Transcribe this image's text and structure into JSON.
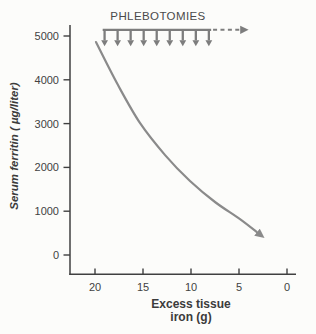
{
  "figure_title": "Serum ferritin response to phlebotomy therapy",
  "chart_data": {
    "type": "line",
    "title": "",
    "xlabel": "Excess tissue iron (g)",
    "xlabel_lines": [
      "Excess tissue",
      "iron (g)"
    ],
    "ylabel": "Serum ferritin ( µg/liter)",
    "x_ticks": [
      20,
      15,
      10,
      5,
      0
    ],
    "y_ticks": [
      0,
      1000,
      2000,
      3000,
      4000,
      5000
    ],
    "x_axis_reversed": true,
    "xlim": [
      22.5,
      -1
    ],
    "ylim": [
      -450,
      5250
    ],
    "grid": false,
    "legend": null,
    "series": [
      {
        "name": "Serum ferritin decline during phlebotomies",
        "points": [
          [
            19.9,
            4860
          ],
          [
            17.6,
            3880
          ],
          [
            15.3,
            3010
          ],
          [
            12.7,
            2280
          ],
          [
            10.1,
            1690
          ],
          [
            7.5,
            1210
          ],
          [
            4.9,
            820
          ],
          [
            3.0,
            500
          ]
        ],
        "ends_with_arrow": true,
        "color": "#8a8a8a"
      }
    ],
    "annotation": {
      "label": "PHLEBOTOMIES",
      "arrow_count": 9,
      "bar_span_g": [
        19.2,
        7.9
      ],
      "dashed_span_g": [
        7.7,
        4.0
      ],
      "level_value": 5140,
      "color": "#7d7d7d"
    },
    "colors": {
      "axis": "#404040",
      "tick_text": "#424242",
      "label_text": "#3b3b3b",
      "background": "#fcfcfa"
    }
  }
}
